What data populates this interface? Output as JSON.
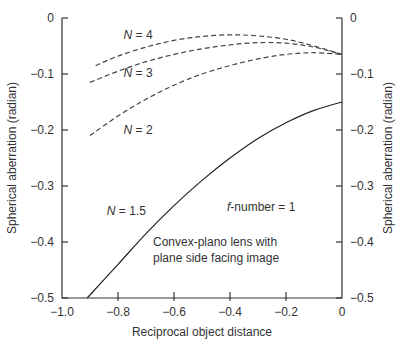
{
  "chart_data": {
    "type": "line",
    "title": "",
    "xlabel": "Reciprocal object distance",
    "ylabel": "Spherical aberration (radian)",
    "ylabel_right": "Spherical aberration (radian)",
    "xlim": [
      -1.0,
      0
    ],
    "ylim": [
      -0.5,
      0
    ],
    "grid": false,
    "x_ticks": [
      "−1.0",
      "−0.8",
      "−0.6",
      "−0.4",
      "−0.2",
      "0"
    ],
    "y_ticks": [
      "0",
      "−0.1",
      "−0.2",
      "−0.3",
      "−0.4",
      "−0.5"
    ],
    "annotations": {
      "fnumber": "-number = 1",
      "fnumber_f": "f",
      "lens_line1": "Convex-plano lens with",
      "lens_line2": "plane side facing image"
    },
    "series": [
      {
        "name": "N = 1.5",
        "style": "solid",
        "x": [
          -0.91,
          -0.8,
          -0.7,
          -0.6,
          -0.5,
          -0.4,
          -0.3,
          -0.2,
          -0.1,
          0
        ],
        "y": [
          -0.5,
          -0.44,
          -0.385,
          -0.335,
          -0.29,
          -0.25,
          -0.215,
          -0.187,
          -0.165,
          -0.15
        ]
      },
      {
        "name": "N = 2",
        "style": "dashed",
        "x": [
          -0.9,
          -0.8,
          -0.7,
          -0.6,
          -0.5,
          -0.4,
          -0.3,
          -0.2,
          -0.1,
          0
        ],
        "y": [
          -0.21,
          -0.175,
          -0.145,
          -0.12,
          -0.1,
          -0.085,
          -0.073,
          -0.065,
          -0.062,
          -0.065
        ]
      },
      {
        "name": "N = 3",
        "style": "dashed",
        "x": [
          -0.9,
          -0.8,
          -0.7,
          -0.6,
          -0.5,
          -0.4,
          -0.3,
          -0.2,
          -0.1,
          0
        ],
        "y": [
          -0.115,
          -0.095,
          -0.078,
          -0.065,
          -0.055,
          -0.048,
          -0.044,
          -0.045,
          -0.052,
          -0.065
        ]
      },
      {
        "name": "N = 4",
        "style": "dashed",
        "x": [
          -0.88,
          -0.8,
          -0.7,
          -0.6,
          -0.5,
          -0.4,
          -0.3,
          -0.2,
          -0.1,
          0
        ],
        "y": [
          -0.085,
          -0.068,
          -0.052,
          -0.04,
          -0.033,
          -0.03,
          -0.032,
          -0.038,
          -0.05,
          -0.065
        ]
      }
    ],
    "series_labels": [
      {
        "text_n": "N",
        "text_v": " = 4",
        "x": -0.78,
        "y": -0.038
      },
      {
        "text_n": "N",
        "text_v": " = 3",
        "x": -0.78,
        "y": -0.106
      },
      {
        "text_n": "N",
        "text_v": " = 2",
        "x": -0.78,
        "y": -0.207
      },
      {
        "text_n": "N",
        "text_v": " = 1.5",
        "x": -0.84,
        "y": -0.352
      }
    ]
  }
}
